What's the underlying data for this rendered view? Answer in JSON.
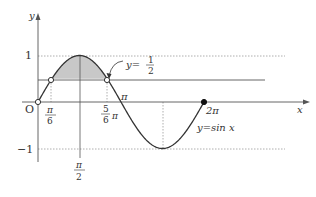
{
  "figure": {
    "curve_label": "y=sin x",
    "line_label_prefix": "y=",
    "line_label_num": "1",
    "line_label_den": "2",
    "axis_x_label": "x",
    "axis_y_label": "y",
    "origin_label": "O",
    "y_ticks": [
      {
        "label": "1",
        "value": 1
      },
      {
        "label": "−1",
        "value": -1
      }
    ],
    "x_ticks": [
      {
        "id": "pi6",
        "num": "π",
        "den": "6"
      },
      {
        "id": "pi2",
        "num": "π",
        "den": "2"
      },
      {
        "id": "5pi6",
        "num": "5",
        "den": "6",
        "suffix": "π"
      },
      {
        "id": "pi",
        "label": "π"
      },
      {
        "id": "2pi",
        "label": "2π"
      }
    ],
    "colors": {
      "curve": "#333333",
      "axis": "#555555",
      "dotted": "#888888",
      "shade": "#c8c8c8"
    }
  },
  "chart_data": {
    "type": "line",
    "title": "",
    "xlabel": "x",
    "ylabel": "y",
    "xlim": [
      0,
      6.2832
    ],
    "ylim": [
      -1,
      1
    ],
    "series": [
      {
        "name": "y=sin x",
        "function": "sin(x)",
        "domain": [
          0,
          6.2832
        ]
      },
      {
        "name": "y=1/2",
        "function": "0.5",
        "style": "horizontal line"
      }
    ],
    "shaded_region": {
      "from_x": 0.5236,
      "to_x": 2.618,
      "between": [
        "y=sin x",
        "y=1/2"
      ]
    },
    "marked_points": [
      {
        "x": 0,
        "y": 0,
        "style": "open circle"
      },
      {
        "x": 0.5236,
        "y": 0.5,
        "style": "open circle",
        "label": "π/6"
      },
      {
        "x": 2.618,
        "y": 0.5,
        "style": "open circle",
        "label": "5π/6"
      },
      {
        "x": 6.2832,
        "y": 0,
        "style": "filled circle",
        "label": "2π"
      }
    ],
    "annotations": [
      "y=1/2",
      "y=sin x",
      "O",
      "π",
      "π/2"
    ]
  }
}
